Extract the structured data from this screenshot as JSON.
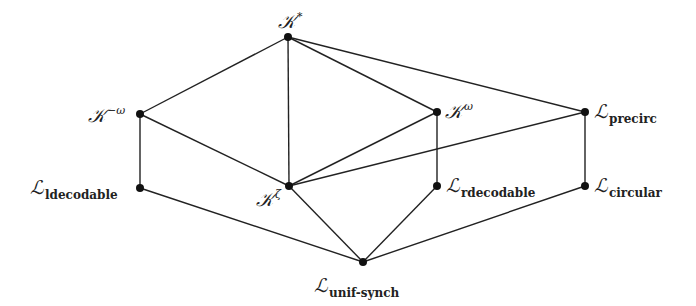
{
  "diagram": {
    "type": "hasse-diagram",
    "nodes": [
      {
        "id": "Kstar",
        "symbol": "𝒦",
        "sup": "*",
        "sub": "",
        "x": 288,
        "y": 37
      },
      {
        "id": "Kminusomega",
        "symbol": "𝒦",
        "sup": "−ω",
        "sub": "",
        "x": 140,
        "y": 114
      },
      {
        "id": "Komega",
        "symbol": "𝒦",
        "sup": "ω",
        "sub": "",
        "x": 437,
        "y": 112
      },
      {
        "id": "Lprecirc",
        "symbol": "ℒ",
        "sup": "",
        "sub": "precirc",
        "x": 585,
        "y": 112
      },
      {
        "id": "Lldecodable",
        "symbol": "ℒ",
        "sup": "",
        "sub": "ldecodable",
        "x": 140,
        "y": 188
      },
      {
        "id": "Kzeta",
        "symbol": "𝒦",
        "sup": "ζ",
        "sub": "",
        "x": 289,
        "y": 186
      },
      {
        "id": "Lrdecodable",
        "symbol": "ℒ",
        "sup": "",
        "sub": "rdecodable",
        "x": 437,
        "y": 186
      },
      {
        "id": "Lcircular",
        "symbol": "ℒ",
        "sup": "",
        "sub": "circular",
        "x": 585,
        "y": 186
      },
      {
        "id": "Lunifsynch",
        "symbol": "ℒ",
        "sup": "",
        "sub": "unif-synch",
        "x": 363,
        "y": 262
      }
    ],
    "edges": [
      [
        "Kstar",
        "Kminusomega"
      ],
      [
        "Kstar",
        "Komega"
      ],
      [
        "Kstar",
        "Kzeta"
      ],
      [
        "Kstar",
        "Lprecirc"
      ],
      [
        "Kminusomega",
        "Lldecodable"
      ],
      [
        "Kminusomega",
        "Kzeta"
      ],
      [
        "Komega",
        "Kzeta"
      ],
      [
        "Komega",
        "Lrdecodable"
      ],
      [
        "Lprecirc",
        "Kzeta"
      ],
      [
        "Lprecirc",
        "Lcircular"
      ],
      [
        "Lldecodable",
        "Lunifsynch"
      ],
      [
        "Kzeta",
        "Lunifsynch"
      ],
      [
        "Lrdecodable",
        "Lunifsynch"
      ],
      [
        "Lcircular",
        "Lunifsynch"
      ]
    ],
    "labels": {
      "Kstar": {
        "symbol": "𝒦",
        "sup": "*"
      },
      "Kminusomega": {
        "symbol": "𝒦",
        "sup": "−ω"
      },
      "Komega": {
        "symbol": "𝒦",
        "sup": "ω"
      },
      "Kzeta": {
        "symbol": "𝒦",
        "sup": "ζ"
      },
      "Lprecirc": {
        "symbol": "ℒ",
        "sub": "precirc"
      },
      "Lldecodable": {
        "symbol": "ℒ",
        "sub": "ldecodable"
      },
      "Lrdecodable": {
        "symbol": "ℒ",
        "sub": "rdecodable"
      },
      "Lcircular": {
        "symbol": "ℒ",
        "sub": "circular"
      },
      "Lunifsynch": {
        "symbol": "ℒ",
        "sub": "unif-synch"
      }
    }
  }
}
